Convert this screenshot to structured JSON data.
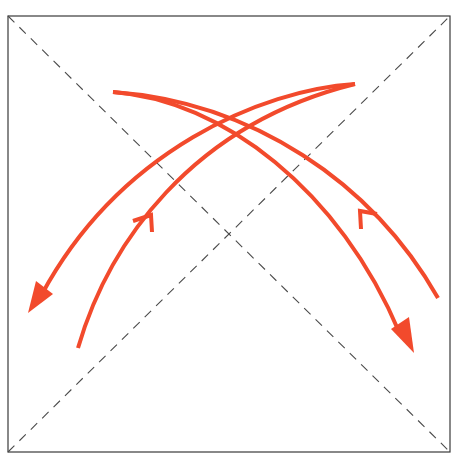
{
  "diagram": {
    "type": "origami-fold-diagram",
    "canvas": {
      "width": 456,
      "height": 462
    },
    "colors": {
      "background": "#ffffff",
      "square_border": "#3a3a3a",
      "fold_line": "#4a4a4a",
      "arrow": "#f24a2c"
    },
    "square": {
      "x1": 8,
      "y1": 16,
      "x2": 450,
      "y2": 452
    },
    "fold_lines": [
      {
        "name": "diagonal-tl-br",
        "style": "dashed",
        "from": [
          8,
          16
        ],
        "to": [
          450,
          452
        ]
      },
      {
        "name": "diagonal-bl-tr",
        "style": "dashed",
        "from": [
          8,
          452
        ],
        "to": [
          450,
          16
        ]
      }
    ],
    "arrows": [
      {
        "name": "arrow-top-right-to-lower-left-filled",
        "start": [
          355,
          84
        ],
        "end": [
          30,
          312
        ],
        "head": "filled",
        "path": "M355,84 C260,92 120,150 44,292"
      },
      {
        "name": "arrow-lower-left-to-top-right-open",
        "start": [
          78,
          348
        ],
        "end": [
          355,
          84
        ],
        "head": "open-chevron",
        "head_position": [
          150,
          216
        ],
        "path": "M78,348 C110,240 190,120 355,84"
      },
      {
        "name": "arrow-top-left-to-lower-right-filled",
        "start": [
          113,
          92
        ],
        "end": [
          413,
          352
        ],
        "head": "filled",
        "path": "M113,92 C220,100 340,190 400,332"
      },
      {
        "name": "arrow-lower-right-to-top-left-open",
        "start": [
          438,
          298
        ],
        "end": [
          113,
          92
        ],
        "head": "open-chevron",
        "head_position": [
          361,
          212
        ],
        "path": "M438,298 C370,180 250,100 113,92"
      }
    ],
    "caption": "Valley-fold diagonals with curved folding arrows"
  }
}
